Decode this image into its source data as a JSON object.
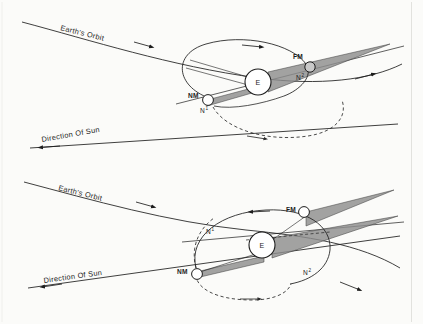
{
  "figure": {
    "background_color": "#fbfbf9",
    "ink_color": "#1d1d1d",
    "shadow_fill": "#8a8a8a",
    "border_color": "#d8d8d4"
  },
  "panels": [
    {
      "id": "upper",
      "name": "nodes-aligned-with-sun-direction",
      "labels": {
        "earth_orbit": "Earth's Orbit",
        "direction_of_sun": "Direction Of Sun",
        "earth": "E",
        "new_moon": "NM",
        "full_moon": "FM",
        "node_ascending": "N",
        "node_ascending_sup": "1",
        "node_descending": "N",
        "node_descending_sup": "2"
      }
    },
    {
      "id": "lower",
      "name": "nodes-perpendicular-to-sun-direction",
      "labels": {
        "earth_orbit": "Earth's Orbit",
        "direction_of_sun": "Direction Of Sun",
        "earth": "E",
        "new_moon": "NM",
        "full_moon": "FM",
        "node_ascending": "N",
        "node_ascending_sup": "1",
        "node_descending": "N",
        "node_descending_sup": "2"
      }
    }
  ]
}
